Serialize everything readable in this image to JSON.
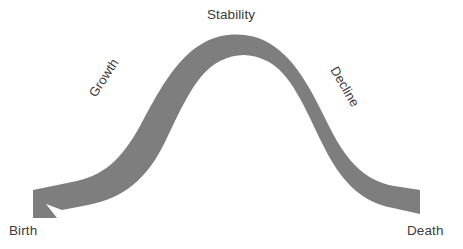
{
  "diagram": {
    "type": "ribbon-arrow-curve",
    "background_color": "#ffffff",
    "ribbon_color": "#7e7e7e",
    "text_color": "#3b3b3b",
    "stage_labels": {
      "growth": "Growth",
      "stability": "Stability",
      "decline": "Decline"
    },
    "endpoint_labels": {
      "start": "Birth",
      "end": "Death"
    },
    "ribbon": {
      "start_cap": "fishtail-notch",
      "end_cap": "arrowhead",
      "thickness_px": 20,
      "peak_x": 235,
      "peak_y": 33
    }
  }
}
